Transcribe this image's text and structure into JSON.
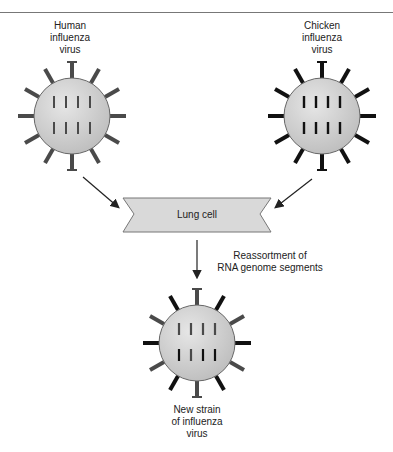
{
  "viruses": {
    "human": {
      "label_lines": [
        "Human",
        "influenza",
        "virus"
      ],
      "spike_color": "#4a4a4a"
    },
    "chicken": {
      "label_lines": [
        "Chicken",
        "influenza",
        "virus"
      ],
      "spike_color": "#111111"
    },
    "new_strain": {
      "label_lines": [
        "New strain",
        "of influenza",
        "virus"
      ]
    }
  },
  "lung_cell": {
    "label": "Lung cell"
  },
  "process": {
    "label_lines": [
      "Reassortment of",
      "RNA genome segments"
    ]
  },
  "colors": {
    "virus_body": "#cfcfcf",
    "lung_cell_fill": "#d9d9d9",
    "segment": "#333333"
  }
}
